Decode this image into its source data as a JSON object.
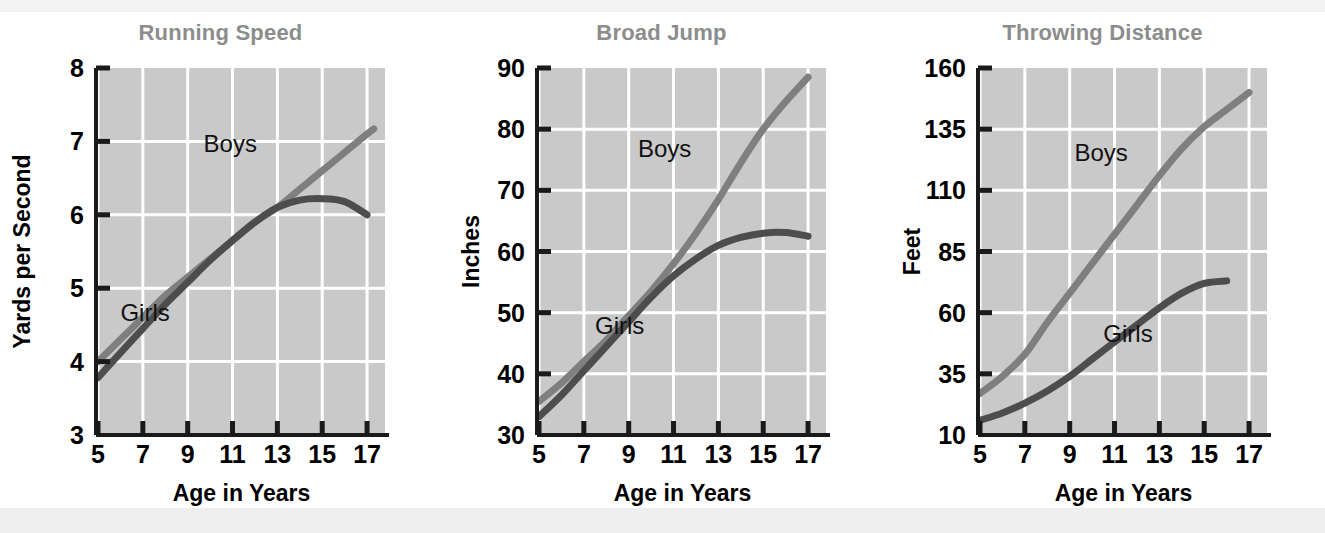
{
  "page": {
    "background_color": "#ffffff",
    "top_band_color": "#f3f3f3",
    "bottom_band_color": "#eeeeee"
  },
  "style": {
    "plot_background": "#c9c9c9",
    "gridline_color": "#ffffff",
    "axis_color": "#1a1a1a",
    "title_color": "#8c8c8c",
    "boys_color": "#7f7f7f",
    "girls_color": "#4d4d4d",
    "label_color": "#111111"
  },
  "chart_data": [
    {
      "id": "running-speed",
      "type": "line",
      "title": "Running Speed",
      "xlabel": "Age in Years",
      "ylabel": "Yards per Second",
      "xlim": [
        5,
        17.8
      ],
      "ylim": [
        3,
        8
      ],
      "xticks": [
        5,
        7,
        9,
        11,
        13,
        15,
        17
      ],
      "xtick_labels": [
        "5",
        "7",
        "9",
        "11",
        "13",
        "15",
        "17"
      ],
      "yticks": [
        3,
        4,
        5,
        6,
        7,
        8
      ],
      "ytick_labels": [
        "3",
        "4",
        "5",
        "6",
        "7",
        "8"
      ],
      "grid": true,
      "legend_position": "inline-annotation",
      "x": [
        5,
        6,
        7,
        8,
        9,
        10,
        11,
        12,
        13,
        14,
        15,
        16,
        17,
        17.3
      ],
      "series": [
        {
          "name": "Boys",
          "color": "#7f7f7f",
          "label_x": 10.9,
          "label_y": 6.85,
          "values": [
            4.0,
            4.3,
            4.6,
            4.9,
            5.15,
            5.4,
            5.65,
            5.9,
            6.1,
            6.35,
            6.6,
            6.85,
            7.1,
            7.17
          ]
        },
        {
          "name": "Girls",
          "color": "#4d4d4d",
          "label_x": 7.1,
          "label_y": 4.55,
          "values": [
            3.78,
            4.12,
            4.45,
            4.78,
            5.08,
            5.38,
            5.65,
            5.9,
            6.1,
            6.2,
            6.22,
            6.18,
            6.0,
            null
          ]
        }
      ]
    },
    {
      "id": "broad-jump",
      "type": "line",
      "title": "Broad Jump",
      "xlabel": "Age in Years",
      "ylabel": "Inches",
      "xlim": [
        5,
        17.8
      ],
      "ylim": [
        30,
        90
      ],
      "xticks": [
        5,
        7,
        9,
        11,
        13,
        15,
        17
      ],
      "xtick_labels": [
        "5",
        "7",
        "9",
        "11",
        "13",
        "15",
        "17"
      ],
      "yticks": [
        30,
        40,
        50,
        60,
        70,
        80,
        90
      ],
      "ytick_labels": [
        "30",
        "40",
        "50",
        "60",
        "70",
        "80",
        "90"
      ],
      "grid": true,
      "legend_position": "inline-annotation",
      "x": [
        5,
        6,
        7,
        8,
        9,
        10,
        11,
        12,
        13,
        14,
        15,
        16,
        17
      ],
      "series": [
        {
          "name": "Boys",
          "color": "#7f7f7f",
          "label_x": 10.6,
          "label_y": 75.5,
          "values": [
            35.5,
            38.5,
            42.0,
            45.5,
            49.5,
            53.5,
            58.0,
            63.0,
            68.5,
            74.5,
            80.0,
            84.5,
            88.5
          ]
        },
        {
          "name": "Girls",
          "color": "#4d4d4d",
          "label_x": 8.6,
          "label_y": 46.5,
          "values": [
            33.0,
            36.5,
            40.5,
            44.5,
            48.5,
            52.5,
            56.0,
            58.8,
            61.0,
            62.3,
            63.0,
            63.1,
            62.5
          ]
        }
      ]
    },
    {
      "id": "throwing-distance",
      "type": "line",
      "title": "Throwing Distance",
      "xlabel": "Age in Years",
      "ylabel": "Feet",
      "xlim": [
        5,
        17.8
      ],
      "ylim": [
        10,
        160
      ],
      "xticks": [
        5,
        7,
        9,
        11,
        13,
        15,
        17
      ],
      "xtick_labels": [
        "5",
        "7",
        "9",
        "11",
        "13",
        "15",
        "17"
      ],
      "yticks": [
        10,
        35,
        60,
        85,
        110,
        135,
        160
      ],
      "ytick_labels": [
        "10",
        "35",
        "60",
        "85",
        "110",
        "135",
        "160"
      ],
      "grid": true,
      "legend_position": "inline-annotation",
      "x": [
        5,
        6,
        7,
        8,
        9,
        10,
        11,
        12,
        13,
        14,
        15,
        16,
        17
      ],
      "series": [
        {
          "name": "Boys",
          "color": "#7f7f7f",
          "label_x": 10.4,
          "label_y": 122.0,
          "values": [
            27.0,
            34.0,
            43.0,
            56.0,
            68.0,
            80.0,
            92.0,
            104.0,
            116.0,
            127.0,
            136.0,
            143.0,
            150.0
          ]
        },
        {
          "name": "Girls",
          "color": "#4d4d4d",
          "label_x": 11.6,
          "label_y": 48.0,
          "values": [
            16.0,
            19.0,
            23.0,
            28.0,
            34.0,
            41.0,
            48.0,
            55.0,
            62.0,
            68.0,
            72.0,
            73.0,
            null
          ]
        }
      ]
    }
  ]
}
